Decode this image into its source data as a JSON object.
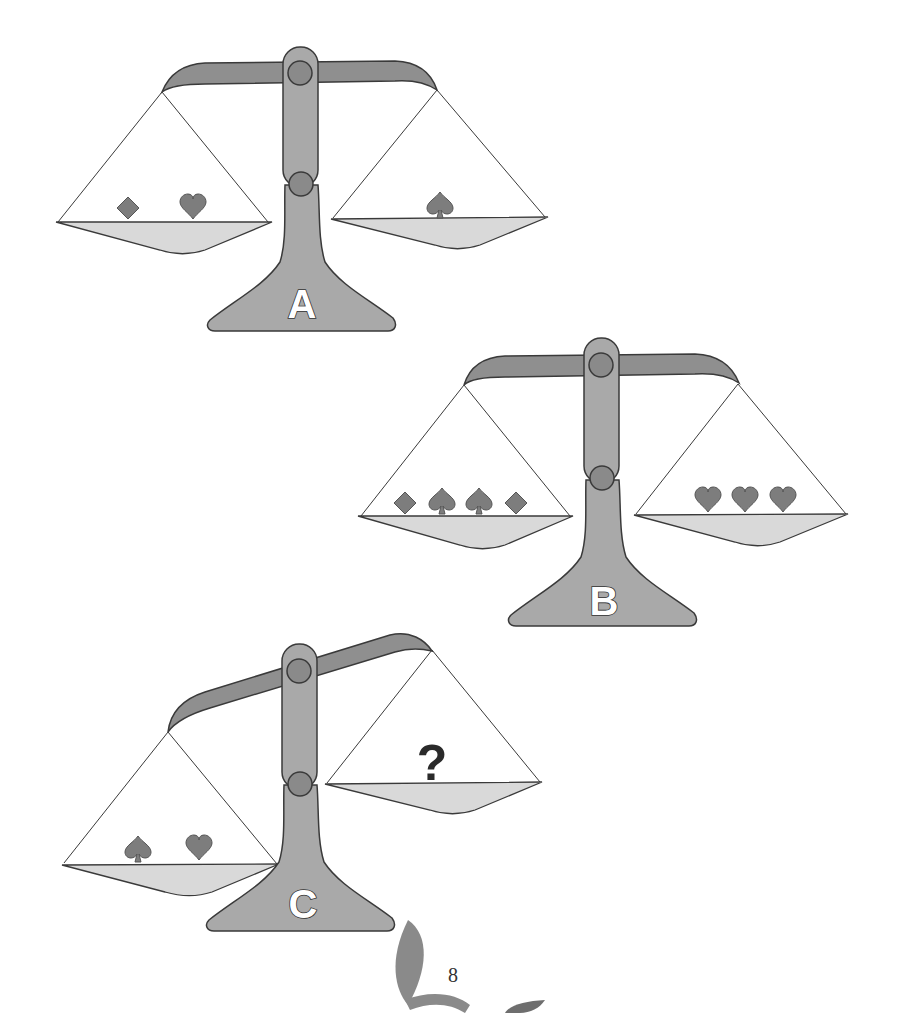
{
  "colors": {
    "beam": "#8f8f8f",
    "column": "#a9a9a9",
    "pivot": "#8a8a8a",
    "pan": "#d9d9d9",
    "suit": "#7d7d7d",
    "outline": "#3a3a3a",
    "background": "#ffffff"
  },
  "scales": [
    {
      "id": "A",
      "label": "A",
      "tilt": "level",
      "left_pan": [
        "diamond",
        "heart"
      ],
      "right_pan": [
        "spade"
      ]
    },
    {
      "id": "B",
      "label": "B",
      "tilt": "level",
      "left_pan": [
        "diamond",
        "spade",
        "spade",
        "diamond"
      ],
      "right_pan": [
        "heart",
        "heart",
        "heart"
      ]
    },
    {
      "id": "C",
      "label": "C",
      "tilt": "left-down",
      "left_pan": [
        "spade",
        "heart"
      ],
      "right_pan": [
        "?"
      ]
    }
  ],
  "question_mark": "?",
  "page_number": "8",
  "footer_logo": "leaf-logo"
}
